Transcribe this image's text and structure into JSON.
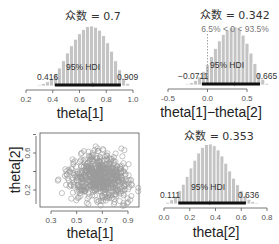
{
  "chart_data": [
    {
      "type": "bar",
      "id": "theta1-posterior",
      "xlabel": "theta[1]",
      "mode_label": "众数 = 0.7",
      "mode": 0.7,
      "hdi_label": "95% HDI",
      "hdi_low": 0.416,
      "hdi_high": 0.909,
      "hdi_low_label": "0.416",
      "hdi_high_label": "0.909",
      "xticks": [
        "0.2",
        "0.4",
        "0.6",
        "0.8",
        "1.0"
      ],
      "xtick_values": [
        0.2,
        0.4,
        0.6,
        0.8,
        1.0
      ],
      "xlim": [
        0.2,
        1.0
      ],
      "bin_centers": [
        0.3,
        0.33,
        0.36,
        0.39,
        0.42,
        0.45,
        0.48,
        0.51,
        0.54,
        0.57,
        0.6,
        0.63,
        0.66,
        0.69,
        0.72,
        0.75,
        0.78,
        0.81,
        0.84,
        0.87,
        0.9,
        0.93,
        0.96
      ],
      "heights": [
        0.02,
        0.04,
        0.07,
        0.12,
        0.2,
        0.3,
        0.42,
        0.55,
        0.67,
        0.78,
        0.87,
        0.94,
        0.99,
        1.0,
        0.98,
        0.93,
        0.84,
        0.72,
        0.58,
        0.42,
        0.27,
        0.13,
        0.04
      ]
    },
    {
      "type": "bar",
      "id": "diff-posterior",
      "xlabel": "theta[1]−theta[2]",
      "mode_label": "众数 = 0.342",
      "mode": 0.342,
      "comparison_label": "6.5% < 0 < 93.5%",
      "comparison_value": 0,
      "pct_below": 6.5,
      "pct_above": 93.5,
      "hdi_label": "95% HDI",
      "hdi_low": -0.0711,
      "hdi_high": 0.665,
      "hdi_low_label": "−0.0711",
      "hdi_high_label": "0.665",
      "xticks": [
        "-0.5",
        "0.0",
        "0.5"
      ],
      "xtick_values": [
        -0.5,
        0.0,
        0.5
      ],
      "xlim": [
        -0.5,
        0.85
      ],
      "bin_centers": [
        -0.25,
        -0.2,
        -0.15,
        -0.1,
        -0.05,
        0.0,
        0.05,
        0.1,
        0.15,
        0.2,
        0.25,
        0.3,
        0.35,
        0.4,
        0.45,
        0.5,
        0.55,
        0.6,
        0.65,
        0.7,
        0.75
      ],
      "heights": [
        0.02,
        0.04,
        0.08,
        0.14,
        0.23,
        0.35,
        0.49,
        0.63,
        0.76,
        0.87,
        0.95,
        0.99,
        1.0,
        0.96,
        0.86,
        0.72,
        0.55,
        0.37,
        0.21,
        0.1,
        0.03
      ]
    },
    {
      "type": "scatter",
      "id": "theta-joint",
      "xlabel": "theta[1]",
      "ylabel": "theta[2]",
      "xticks": [
        "0.3",
        "0.5",
        "0.7",
        "0.9"
      ],
      "xtick_values": [
        0.3,
        0.5,
        0.7,
        0.9
      ],
      "yticks": [
        "0.2",
        "0.6"
      ],
      "ytick_values": [
        0.2,
        0.6
      ],
      "xlim": [
        0.22,
        0.98
      ],
      "ylim": [
        0.03,
        0.82
      ],
      "point_count_approx": 1000,
      "center": [
        0.68,
        0.34
      ],
      "spread": [
        0.12,
        0.12
      ]
    },
    {
      "type": "bar",
      "id": "theta2-posterior",
      "xlabel": "theta[2]",
      "mode_label": "众数 = 0.353",
      "mode": 0.353,
      "hdi_label": "95% HDI",
      "hdi_low": 0.111,
      "hdi_high": 0.636,
      "hdi_low_label": "0.111",
      "hdi_high_label": "0.636",
      "xticks": [
        "0.0",
        "0.2",
        "0.4",
        "0.6",
        "0.8"
      ],
      "xtick_values": [
        0.0,
        0.2,
        0.4,
        0.6,
        0.8
      ],
      "xlim": [
        0.0,
        0.8
      ],
      "bin_centers": [
        0.03,
        0.06,
        0.09,
        0.12,
        0.15,
        0.18,
        0.21,
        0.24,
        0.27,
        0.3,
        0.33,
        0.36,
        0.39,
        0.42,
        0.45,
        0.48,
        0.51,
        0.54,
        0.57,
        0.6,
        0.63,
        0.66,
        0.69,
        0.72,
        0.75
      ],
      "heights": [
        0.03,
        0.07,
        0.13,
        0.22,
        0.33,
        0.46,
        0.6,
        0.73,
        0.85,
        0.94,
        0.99,
        1.0,
        0.97,
        0.9,
        0.8,
        0.68,
        0.55,
        0.43,
        0.32,
        0.22,
        0.14,
        0.08,
        0.04,
        0.02,
        0.01
      ]
    }
  ],
  "colors": {
    "bar_fill": "#c4c4c4",
    "bar_edge": "#ffffff",
    "hdi_bar": "#111111",
    "axis": "#555555",
    "point": "#9a9a9a",
    "comparison_line": "#888888"
  }
}
